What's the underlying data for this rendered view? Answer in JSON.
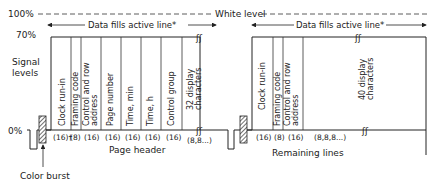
{
  "levels": {
    "white": "100%",
    "white_label": "White level",
    "seventy": "70%",
    "zero": "0%",
    "axis_title_line1": "Signal",
    "axis_title_line2": "levels"
  },
  "annotations": {
    "data_fills_left": "Data fills active line*",
    "data_fills_right": "Data fills active line*",
    "color_burst": "Color burst"
  },
  "page_header": {
    "caption": "Page header",
    "fields": [
      {
        "label1": "Clock run-in",
        "label2": "",
        "bits": "(16)†"
      },
      {
        "label1": "Framing code",
        "label2": "",
        "bits": "(8)"
      },
      {
        "label1": "Control and row",
        "label2": "address",
        "bits": "(16)"
      },
      {
        "label1": "Page number",
        "label2": "",
        "bits": "(16)"
      },
      {
        "label1": "Time, min",
        "label2": "",
        "bits": "(16)"
      },
      {
        "label1": "Time, h",
        "label2": "",
        "bits": "(16)"
      },
      {
        "label1": "Control group",
        "label2": "",
        "bits": "(16)"
      },
      {
        "label1": "32 display",
        "label2": "characters",
        "bits": "(8,8...)"
      }
    ]
  },
  "remaining_lines": {
    "caption": "Remaining lines",
    "fields": [
      {
        "label1": "Clock run-in",
        "label2": "",
        "bits": "(16)"
      },
      {
        "label1": "Framing code",
        "label2": "",
        "bits": "(8)"
      },
      {
        "label1": "Control and row",
        "label2": "address",
        "bits": "(16)"
      },
      {
        "label1": "40 display",
        "label2": "characters",
        "bits": "(8,8,8...)"
      }
    ]
  }
}
